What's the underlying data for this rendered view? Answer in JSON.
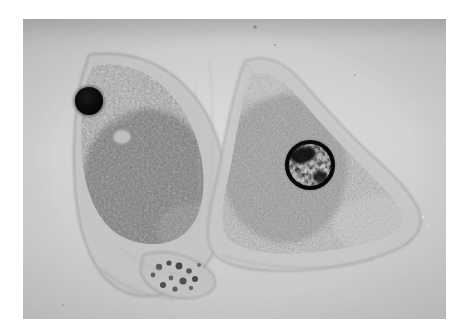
{
  "image": {
    "kind": "photomicrograph",
    "modality": "brightfield-light-microscopy",
    "caption_text": "",
    "background_color": "#ffffff",
    "plate_color": "#d0d0d0",
    "plate": {
      "x": 23,
      "y": 19,
      "width": 423,
      "height": 300
    },
    "subjects": [
      {
        "name": "left-cell",
        "description": "amoeboid cell with coarse dark granular cytoplasm",
        "outline_color": "#9a9a9a",
        "cytoplasm_color": "#6e6e6e",
        "centroid": {
          "x": 120,
          "y": 160
        },
        "nucleus": {
          "name": "left-cell-nucleus",
          "appearance": "solid opaque dark sphere",
          "color": "#0d0d0d",
          "center": {
            "x": 89,
            "y": 101
          },
          "radius": 14
        },
        "vacuole": {
          "name": "left-cell-vacuole",
          "center": {
            "x": 122,
            "y": 137
          },
          "radius": 9,
          "color": "#c8c8c8"
        }
      },
      {
        "name": "right-cell",
        "description": "triangular fan-shaped cell with fine granular cytoplasm",
        "outline_color": "#a5a5a5",
        "cytoplasm_color": "#8d8d8d",
        "centroid": {
          "x": 300,
          "y": 175
        },
        "nucleus": {
          "name": "right-cell-nucleus",
          "appearance": "dark rimmed nucleus with mottled light chromatin",
          "color": "#141414",
          "chromatin_color": "#b9b9b9",
          "center": {
            "x": 310,
            "y": 165
          },
          "radius": 23
        }
      }
    ],
    "features": [
      {
        "name": "bottom-vesicle-cluster",
        "center": {
          "x": 196,
          "y": 273
        },
        "description": "cluster of small vesicles / debris along the lower cell margin"
      },
      {
        "name": "intercellular-gap",
        "center": {
          "x": 207,
          "y": 150
        },
        "description": "pale gap separating the two cells"
      }
    ]
  }
}
